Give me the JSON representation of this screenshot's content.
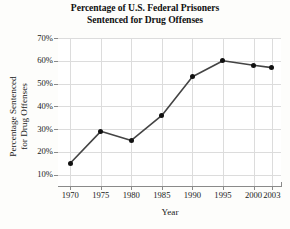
{
  "chart_data": {
    "type": "line",
    "title": "Percentage of U.S. Federal Prisoners Sentenced for Drug Offenses",
    "title_lines": [
      "Percentage of U.S. Federal Prisoners",
      "Sentenced for Drug Offenses"
    ],
    "xlabel": "Year",
    "ylabel": "Percentage Sentenced for Drug Offenses",
    "ylabel_lines": [
      "Percentage Sentenced",
      "for Drug Offenses"
    ],
    "x": [
      1970,
      1975,
      1980,
      1985,
      1990,
      1995,
      2000,
      2003
    ],
    "xtick_labels": [
      "1970",
      "1975",
      "1980",
      "1985",
      "1990",
      "1995",
      "2000",
      "2003"
    ],
    "values": [
      15,
      29,
      25,
      36,
      53,
      60,
      58,
      57
    ],
    "ytick_values": [
      10,
      20,
      30,
      40,
      50,
      60,
      70
    ],
    "ytick_labels": [
      "10%",
      "20%",
      "30%",
      "40%",
      "50%",
      "60%",
      "70%"
    ],
    "xlim": [
      1968,
      2004.5
    ],
    "ylim": [
      5,
      70
    ],
    "grid": true,
    "legend": null,
    "line_color": "#444444",
    "marker_color": "#111111",
    "grid_color": "#dcdcdc",
    "axis_color": "#8a8a8a",
    "background": "#ffffff"
  }
}
